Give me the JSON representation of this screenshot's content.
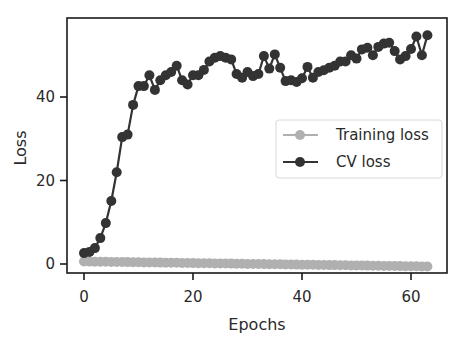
{
  "chart_data": {
    "type": "line",
    "title": "",
    "xlabel": "Epochs",
    "ylabel": "Loss",
    "xlim": [
      -3,
      66
    ],
    "ylim": [
      -2,
      58
    ],
    "xticks": [
      0,
      20,
      40,
      60
    ],
    "yticks": [
      0,
      20,
      40
    ],
    "grid": false,
    "legend_position": "center right",
    "x": [
      0,
      1,
      2,
      3,
      4,
      5,
      6,
      7,
      8,
      9,
      10,
      11,
      12,
      13,
      14,
      15,
      16,
      17,
      18,
      19,
      20,
      21,
      22,
      23,
      24,
      25,
      26,
      27,
      28,
      29,
      30,
      31,
      32,
      33,
      34,
      35,
      36,
      37,
      38,
      39,
      40,
      41,
      42,
      43,
      44,
      45,
      46,
      47,
      48,
      49,
      50,
      51,
      52,
      53,
      54,
      55,
      56,
      57,
      58,
      59,
      60,
      61,
      62,
      63
    ],
    "series": [
      {
        "name": "Training loss",
        "color": "#b0b0b0",
        "marker": "circle",
        "values": [
          0.6,
          0.58,
          0.56,
          0.54,
          0.52,
          0.5,
          0.49,
          0.47,
          0.45,
          0.43,
          0.41,
          0.39,
          0.37,
          0.35,
          0.33,
          0.31,
          0.3,
          0.28,
          0.26,
          0.24,
          0.22,
          0.2,
          0.18,
          0.16,
          0.14,
          0.12,
          0.11,
          0.09,
          0.07,
          0.05,
          0.03,
          0.01,
          -0.01,
          -0.03,
          -0.05,
          -0.07,
          -0.08,
          -0.1,
          -0.12,
          -0.14,
          -0.16,
          -0.18,
          -0.2,
          -0.22,
          -0.24,
          -0.26,
          -0.27,
          -0.29,
          -0.31,
          -0.33,
          -0.35,
          -0.37,
          -0.39,
          -0.41,
          -0.43,
          -0.45,
          -0.46,
          -0.48,
          -0.5,
          -0.52,
          -0.54,
          -0.56,
          -0.58,
          -0.6
        ]
      },
      {
        "name": "CV loss",
        "color": "#333333",
        "marker": "circle",
        "values": [
          2.6,
          2.9,
          3.8,
          6.2,
          9.8,
          15.1,
          22.0,
          30.4,
          31.0,
          38.1,
          42.6,
          42.6,
          45.2,
          41.7,
          44.0,
          45.2,
          46.0,
          47.5,
          44.0,
          43.0,
          45.2,
          45.2,
          46.5,
          48.5,
          49.4,
          49.8,
          49.4,
          49.0,
          45.5,
          44.6,
          46.0,
          45.0,
          45.5,
          49.8,
          46.8,
          50.2,
          47.0,
          43.8,
          44.0,
          43.6,
          44.5,
          47.2,
          44.6,
          46.0,
          46.4,
          47.0,
          47.5,
          48.5,
          48.5,
          50.0,
          49.2,
          51.4,
          51.8,
          50.0,
          52.0,
          52.8,
          53.0,
          51.0,
          49.0,
          49.8,
          51.5,
          54.5,
          50.0,
          54.8
        ]
      }
    ]
  },
  "legend": {
    "items": [
      {
        "label": "Training loss"
      },
      {
        "label": "CV loss"
      }
    ]
  },
  "axes": {
    "xlabel": "Epochs",
    "ylabel": "Loss",
    "xtick_labels": [
      "0",
      "20",
      "40",
      "60"
    ],
    "ytick_labels": [
      "0",
      "20",
      "40"
    ]
  }
}
